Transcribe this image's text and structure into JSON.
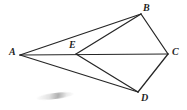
{
  "figure": {
    "kind": "geometry-line-diagram",
    "background_color": "#ffffff",
    "line_color": "#262626",
    "label_color": "#1f1f1f",
    "width": 187,
    "height": 110,
    "vertices": [
      {
        "id": "A",
        "label": "A",
        "x": 20,
        "y": 55
      },
      {
        "id": "B",
        "label": "B",
        "x": 141,
        "y": 14
      },
      {
        "id": "C",
        "label": "C",
        "x": 168,
        "y": 54
      },
      {
        "id": "D",
        "label": "D",
        "x": 138,
        "y": 92
      },
      {
        "id": "E",
        "label": "E",
        "x": 76,
        "y": 54
      }
    ],
    "edges": [
      {
        "from": "A",
        "to": "B"
      },
      {
        "from": "A",
        "to": "D"
      },
      {
        "from": "A",
        "to": "C"
      },
      {
        "from": "E",
        "to": "B"
      },
      {
        "from": "E",
        "to": "D"
      },
      {
        "from": "B",
        "to": "C"
      },
      {
        "from": "C",
        "to": "D"
      }
    ],
    "artifacts": [
      {
        "id": "smudge",
        "kind": "scan-smudge",
        "x": 36,
        "y": 93,
        "width": 38,
        "height": 6
      }
    ]
  },
  "labels": {
    "A": "A",
    "B": "B",
    "C": "C",
    "D": "D",
    "E": "E"
  }
}
